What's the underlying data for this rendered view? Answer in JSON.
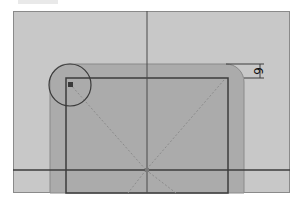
{
  "editor": {
    "canvas_background": "#c8c8c8",
    "shape_fill": "#ababab",
    "line_color": "#3c3c3c",
    "guide_color": "#8c8c8c"
  },
  "shape": {
    "type": "rounded-rectangle",
    "corner_radius_dimension": "6"
  },
  "guides": {
    "vertical_axis": "center-vertical-guide",
    "horizontal_axis": "center-horizontal-guide"
  },
  "handles": {
    "corner_radius_handle": "corner-radius-handle",
    "center_point": "center-point"
  }
}
